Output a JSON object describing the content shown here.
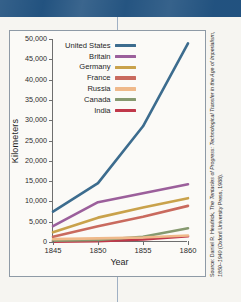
{
  "page": {
    "banner_color": "#1e4f7d",
    "paper_color": "#f6f5f1",
    "divider_color": "#9fb0c4"
  },
  "figure": {
    "source_prefix": "Source: ",
    "source_author": "Daniel R. Headrick, ",
    "source_title": "The Tentacles of Progress: Technological Transfer in the Age of Imperialism, 1850–1940 ",
    "source_publisher": "(Oxford University Press, 1988)."
  },
  "chart_data": {
    "type": "line",
    "title": "",
    "xlabel": "Year",
    "ylabel": "Kilometers",
    "x": [
      1845,
      1850,
      1855,
      1860
    ],
    "xlim": [
      1845,
      1860
    ],
    "ylim": [
      0,
      50000
    ],
    "xticks": [
      1845,
      1850,
      1855,
      1860
    ],
    "xticklabels": [
      "1845",
      "1850",
      "1855",
      "1860"
    ],
    "yticks": [
      0,
      5000,
      10000,
      15000,
      20000,
      25000,
      30000,
      35000,
      40000,
      45000,
      50000
    ],
    "yticklabels": [
      "0",
      "5,000",
      "10,000",
      "15,000",
      "20,000",
      "25,000",
      "30,000",
      "35,000",
      "40,000",
      "45,000",
      "50,000"
    ],
    "grid": false,
    "legend_position": "upper-center",
    "series": [
      {
        "name": "United States",
        "color": "#3c6c8e",
        "values": [
          7500,
          14500,
          28500,
          48900
        ]
      },
      {
        "name": "Britain",
        "color": "#9b5f9b",
        "values": [
          3900,
          9800,
          12000,
          14200
        ]
      },
      {
        "name": "Germany",
        "color": "#c9a24b",
        "values": [
          2400,
          6000,
          8500,
          10800
        ]
      },
      {
        "name": "France",
        "color": "#c96a5e",
        "values": [
          1300,
          3900,
          6200,
          8900
        ]
      },
      {
        "name": "Russia",
        "color": "#efb98a",
        "values": [
          700,
          900,
          1100,
          1600
        ]
      },
      {
        "name": "Canada",
        "color": "#86996f",
        "values": [
          300,
          500,
          1300,
          3400
        ]
      },
      {
        "name": "India",
        "color": "#c0384a",
        "values": [
          100,
          200,
          600,
          1400
        ]
      }
    ]
  }
}
